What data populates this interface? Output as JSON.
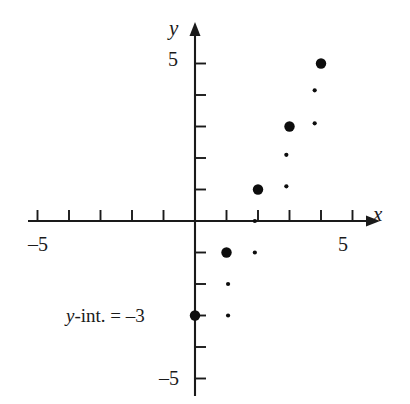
{
  "figure": {
    "kind": "coordinate-plane-scatter",
    "background_color": "#ffffff",
    "ink_color": "#1a1a1a"
  },
  "axes": {
    "x_axis_label": "x",
    "y_axis_label": "y",
    "x_tick_label_left": "–5",
    "x_tick_label_left_value": -5,
    "x_tick_label_right": "5",
    "x_tick_label_right_value": 5,
    "y_tick_label_top": "5",
    "y_tick_label_top_value": 5,
    "y_tick_label_bottom": "–5",
    "y_tick_label_bottom_value": -5
  },
  "annotation": {
    "y_intercept_note_var": "y",
    "y_intercept_note_rest": "-int. = –3",
    "y_intercept_value": -3
  },
  "chart_data": {
    "type": "scatter",
    "title": "",
    "xlabel": "x",
    "ylabel": "y",
    "xlim": [
      -5.6,
      5.6
    ],
    "ylim": [
      -5.6,
      5.6
    ],
    "grid": false,
    "legend": "none",
    "x_ticks": [
      -5,
      -4,
      -3,
      -2,
      -1,
      1,
      2,
      3,
      4,
      5
    ],
    "y_ticks": [
      -5,
      -4,
      -3,
      -2,
      -1,
      1,
      2,
      3,
      4,
      5
    ],
    "x_tick_labels_shown": [
      "–5",
      "5"
    ],
    "y_tick_labels_shown": [
      "5",
      "–5"
    ],
    "series": [
      {
        "name": "plotted-points",
        "marker": "large-filled-circle",
        "marker_radius_px": 5.2,
        "points": [
          {
            "x": 0,
            "y": -3,
            "label": "y-intercept"
          },
          {
            "x": 1,
            "y": -1,
            "label": ""
          },
          {
            "x": 2,
            "y": 1,
            "label": ""
          },
          {
            "x": 3,
            "y": 3,
            "label": ""
          },
          {
            "x": 4,
            "y": 5,
            "label": ""
          }
        ]
      },
      {
        "name": "slope-step-marks",
        "marker": "small-filled-dot",
        "marker_radius_px": 2.1,
        "points": [
          {
            "x": 1.05,
            "y": -3.0
          },
          {
            "x": 1.05,
            "y": -2.0
          },
          {
            "x": 1.9,
            "y": -1.0
          },
          {
            "x": 1.9,
            "y": 0.0
          },
          {
            "x": 2.9,
            "y": 1.1
          },
          {
            "x": 2.9,
            "y": 2.1
          },
          {
            "x": 3.8,
            "y": 3.1
          },
          {
            "x": 3.8,
            "y": 4.15
          }
        ]
      }
    ],
    "implied_line": {
      "slope": 2,
      "intercept": -3,
      "equation": "y = 2x – 3",
      "drawn": false
    },
    "annotations": [
      {
        "text": "y-int. = –3",
        "x": -3.9,
        "y": -3.0,
        "anchor": "right-of-text-at-origin-axis"
      }
    ]
  },
  "geometry": {
    "origin_px": {
      "x": 195,
      "y": 221
    },
    "unit_px": 31.5,
    "tick_len_px": 11
  }
}
